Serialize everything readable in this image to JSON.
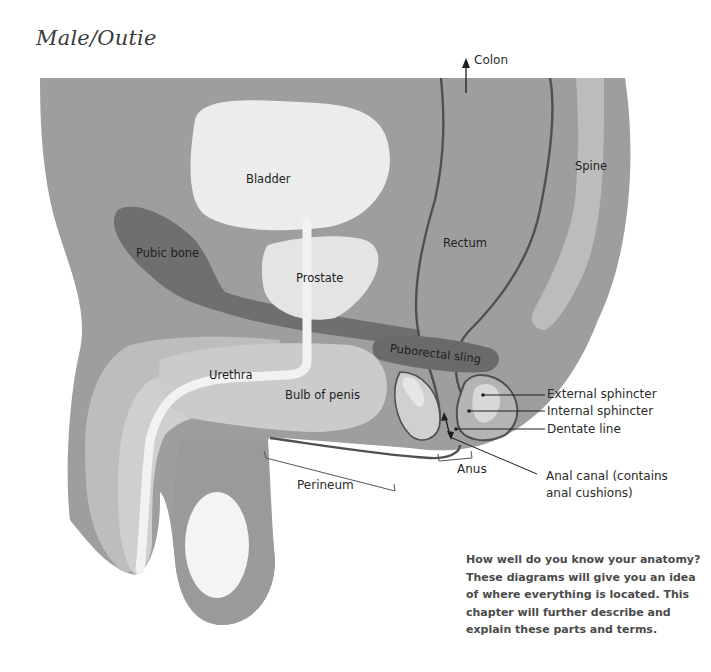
{
  "title": "Male/Outie",
  "labels": {
    "colon": "Colon",
    "bladder": "Bladder",
    "spine": "Spine",
    "rectum": "Rectum",
    "pubic_bone": "Pubic bone",
    "prostate": "Prostate",
    "puborectal_sling": "Puborectal sling",
    "urethra": "Urethra",
    "bulb_of_penis": "Bulb of penis",
    "external_sphincter": "External sphincter",
    "internal_sphincter": "Internal sphincter",
    "dentate_line": "Dentate line",
    "anus": "Anus",
    "perineum": "Perineum",
    "anal_canal_line1": "Anal canal (contains",
    "anal_canal_line2": "anal cushions)"
  },
  "description": "How well do you know your anatomy? These diagrams will give you an idea of where everything is located. This chapter will further describe and explain these parts and terms.",
  "colors": {
    "body": "#9e9e9e",
    "organ_light": "#ececec",
    "tissue_mid": "#bdbdbd",
    "bone_dark": "#6f6f6f",
    "outline": "#505050",
    "text": "#1e1e1e"
  }
}
